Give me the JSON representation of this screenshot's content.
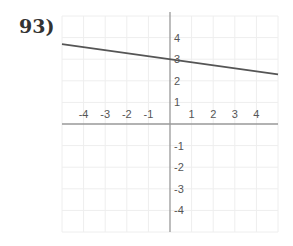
{
  "problem": {
    "number_label": "93)"
  },
  "chart_data": {
    "type": "line",
    "title": "",
    "xlabel": "",
    "ylabel": "",
    "xlim": [
      -5,
      5
    ],
    "ylim": [
      -5,
      5
    ],
    "grid": true,
    "x_tick_labels": [
      "-4",
      "-3",
      "-2",
      "-1",
      "1",
      "2",
      "3",
      "4"
    ],
    "y_tick_labels": [
      "4",
      "3",
      "2",
      "1",
      "-1",
      "-2",
      "-3",
      "-4"
    ],
    "series": [
      {
        "name": "line",
        "equation": "y = -1/7 x + 3",
        "x": [
          -5,
          5
        ],
        "y": [
          3.7,
          2.3
        ],
        "color": "#555555"
      }
    ],
    "y_intercept": 3,
    "slope_estimate": -0.14
  },
  "colors": {
    "axis": "#999999",
    "grid": "#eeeeee",
    "line": "#555555"
  }
}
